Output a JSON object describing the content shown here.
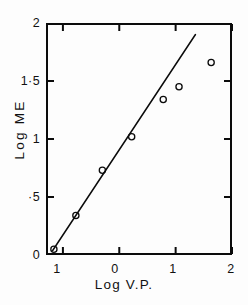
{
  "chart_data": {
    "type": "scatter",
    "title": "",
    "subtitle": "",
    "xlabel": "Log V.P.",
    "ylabel": "Log ME",
    "xlim": [
      -1.3,
      2.0
    ],
    "ylim": [
      0.0,
      2.0
    ],
    "grid": false,
    "legend": null,
    "xticks": [
      {
        "value": -1,
        "label": "1"
      },
      {
        "value": 0,
        "label": "0"
      },
      {
        "value": 1,
        "label": "1"
      },
      {
        "value": 2,
        "label": "2"
      }
    ],
    "yticks": [
      {
        "value": 0,
        "label": "0"
      },
      {
        "value": 0.5,
        "label": "·5"
      },
      {
        "value": 1.0,
        "label": "1"
      },
      {
        "value": 1.5,
        "label": "1·5"
      },
      {
        "value": 2.0,
        "label": "2"
      }
    ],
    "series": [
      {
        "name": "data",
        "marker": "open-circle",
        "x": [
          -1.16,
          -0.77,
          -0.3,
          0.22,
          0.78,
          1.06,
          1.63
        ],
        "y": [
          0.05,
          0.34,
          0.73,
          1.02,
          1.34,
          1.45,
          1.66
        ]
      }
    ],
    "fit_line": {
      "name": "regression-line",
      "x_start": -1.18,
      "y_start": 0.04,
      "x_end": 1.35,
      "y_end": 1.9
    }
  },
  "axes": {
    "x_title": "Log V.P.",
    "y_title": "Log ME"
  }
}
